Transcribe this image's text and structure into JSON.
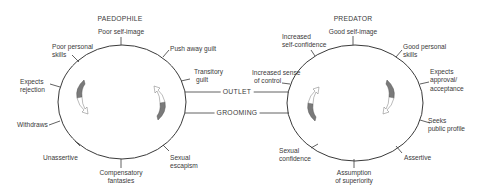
{
  "diagram": {
    "left_cycle": {
      "title": "PAEDOPHILE",
      "labels": {
        "top": "Poor self-image",
        "upper_left": [
          "Poor personal",
          "skills"
        ],
        "upper_right": "Push away guilt",
        "right": [
          "Transitory",
          "guilt"
        ],
        "left_upper": [
          "Expects",
          "rejection"
        ],
        "left_lower": "Withdraws",
        "lower_left": "Unassertive",
        "bottom": [
          "Compensatory",
          "fantasies"
        ],
        "lower_right": [
          "Sexual",
          "escapism"
        ]
      }
    },
    "right_cycle": {
      "title": "PREDATOR",
      "labels": {
        "top": "Good self-image",
        "upper_left": [
          "Increased",
          "self-confidence"
        ],
        "upper_right": [
          "Good personal",
          "skills"
        ],
        "left": [
          "Increased sense",
          "of control"
        ],
        "right_upper": [
          "Expects",
          "approval/",
          "acceptance"
        ],
        "right_lower": [
          "Seeks",
          "public profile"
        ],
        "lower_right": "Assertive",
        "bottom": [
          "Assumption",
          "of superiority"
        ],
        "lower_left": [
          "Sexual",
          "confidence"
        ]
      }
    },
    "connectors": {
      "outlet": "OUTLET",
      "grooming": "GROOMING"
    },
    "colors": {
      "line": "#3a3a3a",
      "arrow_fill": "#7a7a7a"
    }
  }
}
